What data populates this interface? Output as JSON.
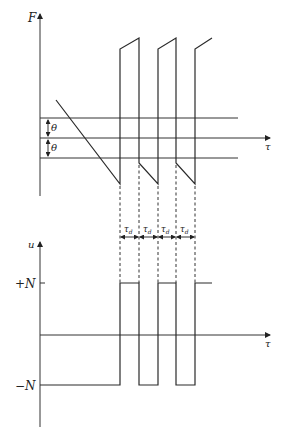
{
  "top_plot": {
    "y_axis_label": "F",
    "x_axis_label": "τ",
    "threshold_label_upper": "θ",
    "threshold_label_lower": "θ"
  },
  "bottom_plot": {
    "y_axis_label": "u",
    "x_axis_label": "τ",
    "level_high": "+N",
    "level_low": "−N"
  },
  "delay_labels": [
    "τd",
    "τd",
    "τd",
    "τd"
  ],
  "delay_subscript": "d",
  "delay_symbol": "τ"
}
